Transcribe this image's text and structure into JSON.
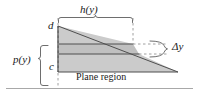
{
  "figure": {
    "caption_text": "Plane region",
    "labels": {
      "width_function": "h(y)",
      "upper_limit": "d",
      "lower_limit": "c",
      "depth_function": "p(y)",
      "thickness": "Δy",
      "region_caption": "Plane region"
    },
    "colors": {
      "region_fill": "#cccccc",
      "strip_fill": "#c2c2c2",
      "outline": "#555555",
      "dashed": "#9a9a9a",
      "brace": "#6e6e6e",
      "surface_line": "#a8a8a8",
      "text": "#1a1a1a",
      "background": "#ffffff"
    },
    "geometry": {
      "region_top_y": 26,
      "region_bottom_y": 72,
      "region_left_x": 58,
      "region_right_x": 133,
      "strip_top_y": 44,
      "strip_bottom_y": 54,
      "surface_line_y": 88,
      "apex_x": 178,
      "apex_y": 72
    }
  }
}
